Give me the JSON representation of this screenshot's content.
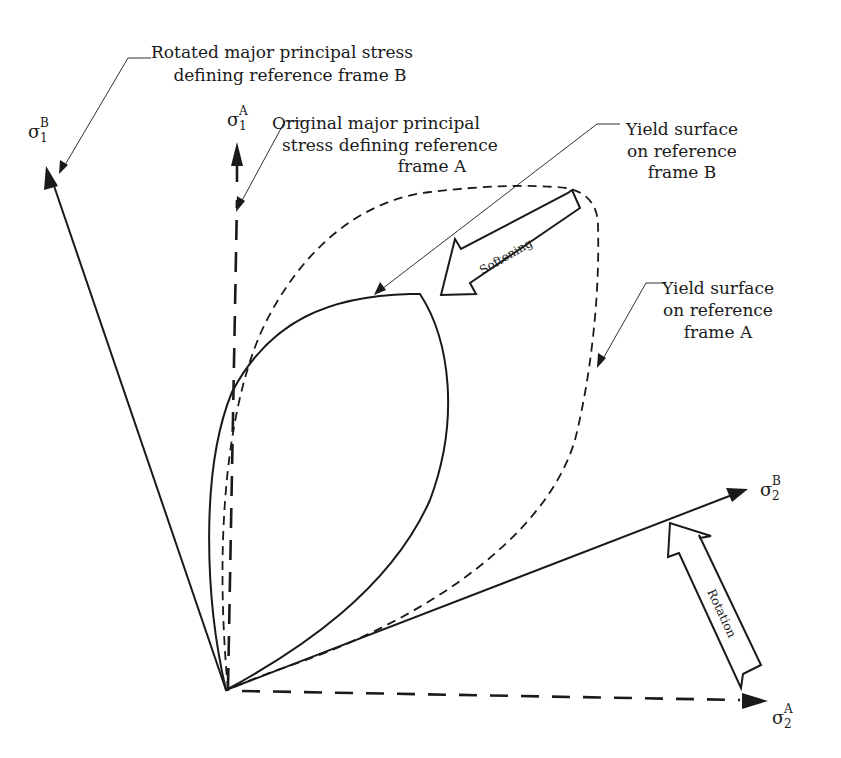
{
  "diagram": {
    "axes": {
      "sigma1B": {
        "symbol": "σ",
        "sub": "1",
        "sup": "B"
      },
      "sigma1A": {
        "symbol": "σ",
        "sub": "1",
        "sup": "A"
      },
      "sigma2B": {
        "symbol": "σ",
        "sub": "2",
        "sup": "B"
      },
      "sigma2A": {
        "symbol": "σ",
        "sub": "2",
        "sup": "A"
      }
    },
    "callouts": {
      "rotated_major": {
        "lines": [
          "Rotated major principal stress",
          "defining reference frame B"
        ]
      },
      "original_major": {
        "lines": [
          "Original major principal",
          "stress defining reference",
          "frame A"
        ]
      },
      "yield_B": {
        "lines": [
          "Yield surface",
          "on reference",
          "frame B"
        ]
      },
      "yield_A": {
        "lines": [
          "Yield surface",
          "on reference",
          "frame A"
        ]
      }
    },
    "block_arrows": {
      "softening": "Softening",
      "rotation": "Rotation"
    },
    "colors": {
      "stroke": "#1a1a1a",
      "background": "#ffffff"
    }
  }
}
